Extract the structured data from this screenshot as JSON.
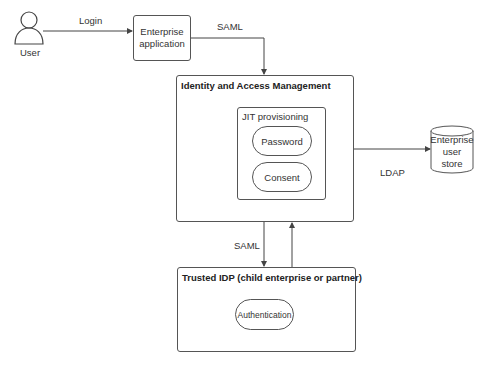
{
  "diagram": {
    "actors": {
      "user": {
        "label": "User"
      }
    },
    "nodes": {
      "enterprise_app": {
        "line1": "Enterprise",
        "line2": "application"
      },
      "iam": {
        "title": "Identity and Access Management"
      },
      "jit": {
        "title": "JIT provisioning"
      },
      "password": {
        "label": "Password"
      },
      "consent": {
        "label": "Consent"
      },
      "user_store": {
        "line1": "Enterprise",
        "line2": "user store"
      },
      "trusted_idp": {
        "title": "Trusted IDP (child enterprise or partner)"
      },
      "authentication": {
        "label": "Authentication"
      }
    },
    "edges": {
      "login": {
        "label": "Login"
      },
      "saml_top": {
        "label": "SAML"
      },
      "ldap": {
        "label": "LDAP"
      },
      "saml_bottom": {
        "label": "SAML"
      }
    },
    "colors": {
      "stroke": "#555555",
      "text": "#333333",
      "background": "#ffffff"
    }
  }
}
